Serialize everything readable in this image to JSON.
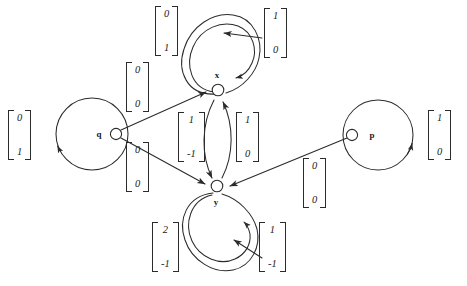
{
  "diagram": {
    "background_color": "#ffffff",
    "stroke_color": "#2b2b2b",
    "nodes": [
      {
        "id": "q",
        "label": "q",
        "cx": 92,
        "cy": 134
      },
      {
        "id": "x",
        "label": "x",
        "cx": 219,
        "cy": 88
      },
      {
        "id": "y",
        "label": "y",
        "cx": 217,
        "cy": 189
      },
      {
        "id": "p",
        "label": "p",
        "cx": 378,
        "cy": 135
      }
    ],
    "vectors": [
      {
        "name": "q-self-loop-weight",
        "top": "0",
        "bottom": "1",
        "x": 8,
        "y": 110
      },
      {
        "name": "q-to-x-weight",
        "top": "0",
        "bottom": "0",
        "x": 126,
        "y": 62
      },
      {
        "name": "q-to-y-weight",
        "top": "0",
        "bottom": "0",
        "x": 126,
        "y": 142
      },
      {
        "name": "x-self-loop-weight",
        "top": "0",
        "bottom": "1",
        "x": 155,
        "y": 6
      },
      {
        "name": "x-inbound-weight",
        "top": "1",
        "bottom": "0",
        "x": 264,
        "y": 8
      },
      {
        "name": "x-to-y-weight",
        "top": "1",
        "bottom": "-1",
        "x": 178,
        "y": 112
      },
      {
        "name": "y-to-x-weight",
        "top": "1",
        "bottom": "0",
        "x": 236,
        "y": 112
      },
      {
        "name": "y-self-loop-weight",
        "top": "2",
        "bottom": "-1",
        "x": 152,
        "y": 222
      },
      {
        "name": "y-inbound-weight",
        "top": "1",
        "bottom": "-1",
        "x": 259,
        "y": 222
      },
      {
        "name": "p-to-y-weight",
        "top": "0",
        "bottom": "0",
        "x": 303,
        "y": 158
      },
      {
        "name": "p-self-loop-weight",
        "top": "1",
        "bottom": "0",
        "x": 428,
        "y": 110
      }
    ]
  }
}
